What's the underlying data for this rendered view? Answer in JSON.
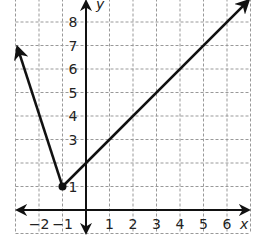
{
  "chart_data": {
    "type": "line",
    "title": "",
    "xlabel": "x",
    "ylabel": "y",
    "xlim": [
      -3,
      7
    ],
    "ylim": [
      -1,
      9
    ],
    "grid": true,
    "x_ticks": [
      "−2",
      "−1",
      "1",
      "2",
      "3",
      "4",
      "5",
      "6"
    ],
    "y_ticks": [
      "1",
      "3",
      "4",
      "5",
      "6",
      "7",
      "8"
    ],
    "series": [
      {
        "name": "absolute value graph",
        "points": [
          [
            -3,
            7
          ],
          [
            -1,
            1
          ],
          [
            6.9,
            8.9
          ]
        ],
        "vertex": [
          -1,
          1
        ],
        "arrows": "both ends"
      }
    ]
  },
  "labels": {
    "x_axis": "x",
    "y_axis": "y"
  }
}
